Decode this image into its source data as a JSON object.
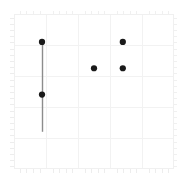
{
  "chart_data": {
    "type": "scatter",
    "title": "",
    "subtitle": "",
    "xlabel": "",
    "ylabel": "",
    "xlim": [
      0,
      5
    ],
    "ylim": [
      0,
      5
    ],
    "grid": true,
    "grid_color": "#f2f2f2",
    "frame_color": "#f0f0f0",
    "legend": null,
    "legend_position": "none",
    "xticks": [
      0,
      1,
      2,
      3,
      4,
      5
    ],
    "yticks": [
      0,
      1,
      2,
      3,
      4,
      5
    ],
    "xticklabels": [
      "",
      "",
      "",
      "",
      "",
      ""
    ],
    "yticklabels": [
      "",
      "",
      "",
      "",
      "",
      ""
    ],
    "minor_ticks": true,
    "marker": "circle",
    "marker_color": "#1a1a1a",
    "marker_size": 4,
    "points": [
      {
        "name": "point-a-upper",
        "x": 0.875,
        "y": 4.1
      },
      {
        "name": "point-a-lower",
        "x": 0.875,
        "y": 2.4
      },
      {
        "name": "point-b",
        "x": 2.5,
        "y": 3.25
      },
      {
        "name": "point-c-upper",
        "x": 3.4,
        "y": 4.1
      },
      {
        "name": "point-c-lower",
        "x": 3.4,
        "y": 3.25
      }
    ],
    "errorbars": [
      {
        "name": "errorbar-a",
        "x": 0.875,
        "y_top": 4.1,
        "y_bottom": 1.2,
        "color": "#8c8c8c",
        "linewidth": 1.4
      }
    ],
    "axes_pixels": {
      "left": 14,
      "right": 174,
      "top": 14,
      "bottom": 169
    }
  }
}
